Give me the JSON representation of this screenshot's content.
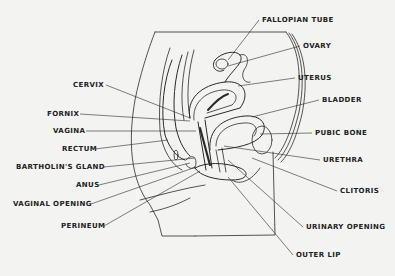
{
  "diagram": {
    "colors": {
      "ink": "#2a2a2a",
      "background": "#f3f3f1"
    },
    "labels_left": [
      {
        "id": "cervix",
        "text": "CERVIX",
        "x": 103,
        "y": 81,
        "tx": 190,
        "ty": 118
      },
      {
        "id": "fornix",
        "text": "FORNIX",
        "x": 77,
        "y": 110,
        "tx": 190,
        "ty": 121
      },
      {
        "id": "vagina",
        "text": "VAGINA",
        "x": 83,
        "y": 127,
        "tx": 196,
        "ty": 131
      },
      {
        "id": "rectum",
        "text": "RECTUM",
        "x": 92,
        "y": 145,
        "tx": 168,
        "ty": 140
      },
      {
        "id": "bartholins-gland",
        "text": "BARTHOLIN'S GLAND",
        "x": 101,
        "y": 163,
        "tx": 195,
        "ty": 158
      },
      {
        "id": "anus",
        "text": "ANUS",
        "x": 96,
        "y": 181,
        "tx": 190,
        "ty": 163
      },
      {
        "id": "vaginal-opening",
        "text": "VAGINAL OPENING",
        "x": 88,
        "y": 200,
        "tx": 196,
        "ty": 167
      },
      {
        "id": "perineum",
        "text": "PERINEUM",
        "x": 101,
        "y": 222,
        "tx": 200,
        "ty": 171
      }
    ],
    "labels_right": [
      {
        "id": "fallopian-tube",
        "text": "FALLOPIAN TUBE",
        "x": 262,
        "y": 16,
        "tx": 228,
        "ty": 60
      },
      {
        "id": "ovary",
        "text": "OVARY",
        "x": 303,
        "y": 42,
        "tx": 228,
        "ty": 66
      },
      {
        "id": "uterus",
        "text": "UTERUS",
        "x": 298,
        "y": 74,
        "tx": 238,
        "ty": 86
      },
      {
        "id": "bladder",
        "text": "BLADDER",
        "x": 322,
        "y": 96,
        "tx": 252,
        "ty": 117
      },
      {
        "id": "pubic-bone",
        "text": "PUBIC BONE",
        "x": 315,
        "y": 129,
        "tx": 260,
        "ty": 134
      },
      {
        "id": "urethra",
        "text": "URETHRA",
        "x": 323,
        "y": 156,
        "tx": 224,
        "ty": 146
      },
      {
        "id": "clitoris",
        "text": "CLITORIS",
        "x": 340,
        "y": 187,
        "tx": 252,
        "ty": 158
      },
      {
        "id": "urinary-opening",
        "text": "URINARY OPENING",
        "x": 306,
        "y": 223,
        "tx": 228,
        "ty": 160
      },
      {
        "id": "outer-lip",
        "text": "OUTER LIP",
        "x": 296,
        "y": 251,
        "tx": 228,
        "ty": 177
      }
    ]
  }
}
